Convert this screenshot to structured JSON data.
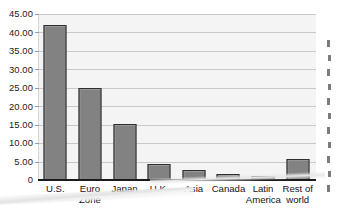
{
  "chart_data": {
    "type": "bar",
    "title": "",
    "subtitle": "",
    "xlabel": "",
    "ylabel": "",
    "categories": [
      "U.S.",
      "Euro Zone",
      "Japan",
      "U.K.",
      "Asia",
      "Canada",
      "Latin America",
      "Rest of world"
    ],
    "category_lines": [
      [
        "U.S."
      ],
      [
        "Euro",
        "Zone"
      ],
      [
        "Japan"
      ],
      [
        "U.K."
      ],
      [
        "Asia"
      ],
      [
        "Canada"
      ],
      [
        "Latin",
        "America"
      ],
      [
        "Rest of",
        "world"
      ]
    ],
    "values": [
      42.0,
      25.0,
      15.3,
      4.3,
      2.8,
      1.6,
      1.0,
      5.6
    ],
    "ylim": [
      0,
      45
    ],
    "ytick_values": [
      45,
      40,
      35,
      30,
      25,
      20,
      15,
      10,
      5,
      0
    ],
    "ytick_labels": [
      "45.00",
      "40.00",
      "35.00",
      "30.00",
      "25.00",
      "20.00",
      "15.00",
      "10.00",
      "5.00",
      "0"
    ],
    "grid": true,
    "grid_axis": "y",
    "legend": false,
    "legend_position": "none",
    "bar_color": "#828282",
    "bar_border_color": "#2e2e2e",
    "plot_background": "#f4f4f4",
    "gridline_color": "#c9c9c9",
    "axis_color": "#1c1c1c",
    "annotations": []
  },
  "figure": {
    "background": "#ffffff",
    "scan_artifact": true
  }
}
